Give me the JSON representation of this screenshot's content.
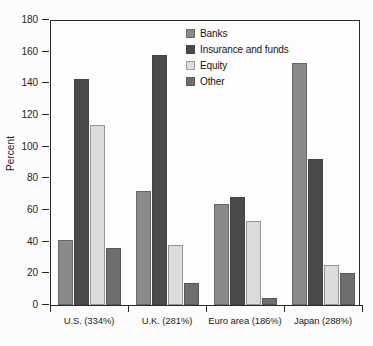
{
  "chart_data": {
    "type": "bar",
    "title": "",
    "xlabel": "",
    "ylabel": "Percent",
    "ylim": [
      0,
      180
    ],
    "yticks": [
      0,
      20,
      40,
      60,
      80,
      100,
      120,
      140,
      160,
      180
    ],
    "grid": false,
    "legend_position": "top-center",
    "categories": [
      "U.S. (334%)",
      "U.K. (281%)",
      "Euro area (186%)",
      "Japan (288%)"
    ],
    "series": [
      {
        "name": "Banks",
        "color": "#8a8a8a",
        "values": [
          41,
          72,
          64,
          153
        ]
      },
      {
        "name": "Insurance and funds",
        "color": "#4a4a4a",
        "values": [
          143,
          158,
          68,
          92
        ]
      },
      {
        "name": "Equity",
        "color": "#dcdcdc",
        "values": [
          114,
          38,
          53,
          25
        ]
      },
      {
        "name": "Other",
        "color": "#6e6e6e",
        "values": [
          36,
          14,
          4.5,
          20
        ]
      }
    ]
  },
  "axis": {
    "y_tick_labels": [
      "180",
      "160",
      "140",
      "120",
      "100",
      "80",
      "60",
      "40",
      "20",
      "0"
    ],
    "y_axis_title": "Percent"
  },
  "legend": {
    "items": [
      {
        "label": "Banks"
      },
      {
        "label": "Insurance and funds"
      },
      {
        "label": "Equity"
      },
      {
        "label": "Other"
      }
    ]
  }
}
